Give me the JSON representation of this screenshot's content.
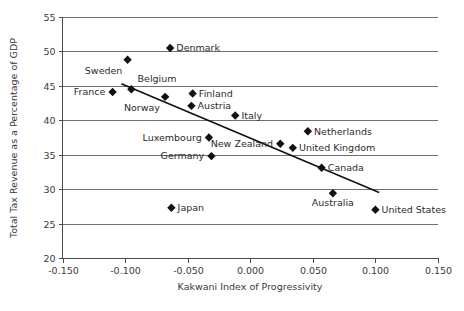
{
  "chart_data": {
    "type": "scatter",
    "title": "",
    "xlabel": "Kakwani Index of Progressivity",
    "ylabel": "Total Tax Revenue as a Percentage of GDP",
    "xlim": [
      -0.15,
      0.15
    ],
    "ylim": [
      20,
      55
    ],
    "xticks": [
      "-0.150",
      "-0.100",
      "-0.050",
      "0.000",
      "0.050",
      "0.100",
      "0.150"
    ],
    "xtick_values": [
      -0.15,
      -0.1,
      -0.05,
      0.0,
      0.05,
      0.1,
      0.15
    ],
    "yticks": [
      "20",
      "25",
      "30",
      "35",
      "40",
      "45",
      "50",
      "55"
    ],
    "ytick_values": [
      20,
      25,
      30,
      35,
      40,
      45,
      50,
      55
    ],
    "grid": "horizontal",
    "legend": "none",
    "marker_shape": "diamond",
    "marker_color": "#111111",
    "points": [
      {
        "name": "Denmark",
        "x": -0.064,
        "y": 50.5,
        "label_pos": "right"
      },
      {
        "name": "Sweden",
        "x": -0.098,
        "y": 48.8,
        "label_pos": "below-left"
      },
      {
        "name": "Belgium",
        "x": -0.095,
        "y": 44.5,
        "label_pos": "above-right"
      },
      {
        "name": "France",
        "x": -0.11,
        "y": 44.1,
        "label_pos": "left"
      },
      {
        "name": "Norway",
        "x": -0.068,
        "y": 43.4,
        "label_pos": "below-left"
      },
      {
        "name": "Finland",
        "x": -0.046,
        "y": 43.9,
        "label_pos": "right"
      },
      {
        "name": "Austria",
        "x": -0.047,
        "y": 42.1,
        "label_pos": "right"
      },
      {
        "name": "Italy",
        "x": -0.012,
        "y": 40.7,
        "label_pos": "right"
      },
      {
        "name": "Netherlands",
        "x": 0.046,
        "y": 38.4,
        "label_pos": "right"
      },
      {
        "name": "Luxembourg",
        "x": -0.033,
        "y": 37.5,
        "label_pos": "left"
      },
      {
        "name": "New Zealand",
        "x": 0.024,
        "y": 36.6,
        "label_pos": "left"
      },
      {
        "name": "United Kingdom",
        "x": 0.034,
        "y": 36.0,
        "label_pos": "right"
      },
      {
        "name": "Germany",
        "x": -0.031,
        "y": 34.8,
        "label_pos": "left"
      },
      {
        "name": "Canada",
        "x": 0.057,
        "y": 33.1,
        "label_pos": "right"
      },
      {
        "name": "Australia",
        "x": 0.066,
        "y": 29.4,
        "label_pos": "below"
      },
      {
        "name": "United States",
        "x": 0.1,
        "y": 27.0,
        "label_pos": "right"
      },
      {
        "name": "Japan",
        "x": -0.063,
        "y": 27.3,
        "label_pos": "right"
      }
    ],
    "trendline": {
      "x_start": -0.103,
      "y_start": 45.3,
      "x_end": 0.103,
      "y_end": 29.5
    }
  }
}
